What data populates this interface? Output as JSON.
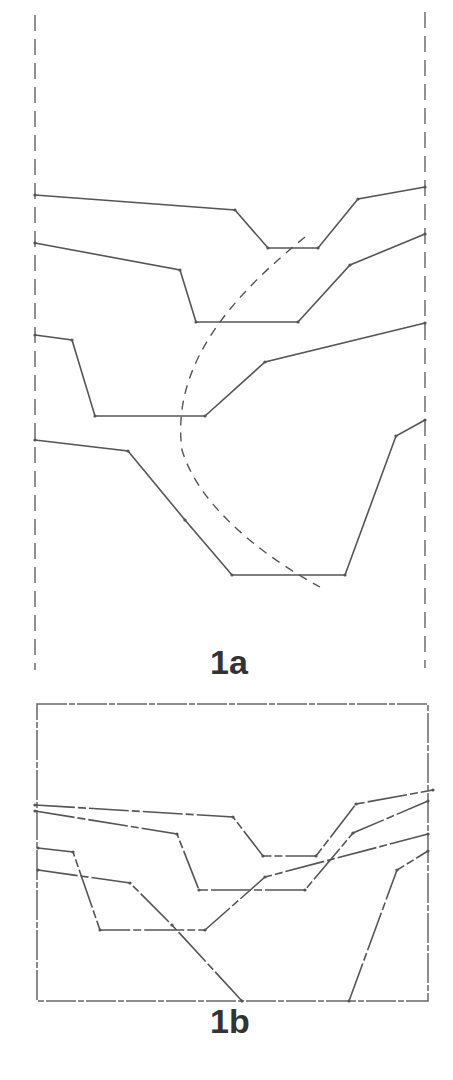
{
  "figures": {
    "fig1a": {
      "label": "1a",
      "boundary_left_x": 35,
      "boundary_right_x": 425,
      "profiles": [
        {
          "name": "profile-1",
          "points": [
            [
              35,
              195
            ],
            [
              235,
              210
            ],
            [
              268,
              248
            ],
            [
              318,
              248
            ],
            [
              358,
              199
            ],
            [
              425,
              187
            ]
          ]
        },
        {
          "name": "profile-2",
          "points": [
            [
              35,
              243
            ],
            [
              180,
              270
            ],
            [
              196,
              322
            ],
            [
              298,
              322
            ],
            [
              350,
              265
            ],
            [
              425,
              234
            ]
          ]
        },
        {
          "name": "profile-3",
          "points": [
            [
              35,
              335
            ],
            [
              72,
              340
            ],
            [
              95,
              416
            ],
            [
              205,
              416
            ],
            [
              265,
              362
            ],
            [
              425,
              323
            ]
          ]
        },
        {
          "name": "profile-4",
          "points": [
            [
              35,
              440
            ],
            [
              128,
              451
            ],
            [
              185,
              520
            ],
            [
              232,
              575
            ],
            [
              345,
              575
            ],
            [
              396,
              436
            ],
            [
              425,
              420
            ]
          ]
        }
      ],
      "trajectory_dashed": "M305 237 C 240 290, 170 360, 182 450 C 200 510, 270 560, 320 587"
    },
    "fig1b": {
      "label": "1b",
      "frame": {
        "x": 37,
        "y": 704,
        "w": 391,
        "h": 297
      },
      "profiles": [
        {
          "name": "profile-1",
          "points": [
            [
              35,
              805
            ],
            [
              233,
              817
            ],
            [
              263,
              856
            ],
            [
              316,
              856
            ],
            [
              356,
              804
            ],
            [
              433,
              790
            ]
          ]
        },
        {
          "name": "profile-2",
          "points": [
            [
              35,
              811
            ],
            [
              177,
              834
            ],
            [
              199,
              890
            ],
            [
              305,
              890
            ],
            [
              353,
              833
            ],
            [
              428,
              801
            ]
          ]
        },
        {
          "name": "profile-3",
          "points": [
            [
              38,
              848
            ],
            [
              73,
              852
            ],
            [
              100,
              930
            ],
            [
              205,
              930
            ],
            [
              265,
              877
            ],
            [
              428,
              834
            ]
          ]
        },
        {
          "name": "profile-4",
          "points": [
            [
              38,
              870
            ],
            [
              130,
              883
            ],
            [
              172,
              925
            ],
            [
              242,
              1001
            ]
          ]
        },
        {
          "name": "profile-4-right",
          "points": [
            [
              349,
              1001
            ],
            [
              397,
              870
            ],
            [
              428,
              851
            ]
          ]
        }
      ]
    }
  },
  "colors": {
    "line": "#555555",
    "line_light": "#888888",
    "label": "#333333"
  }
}
